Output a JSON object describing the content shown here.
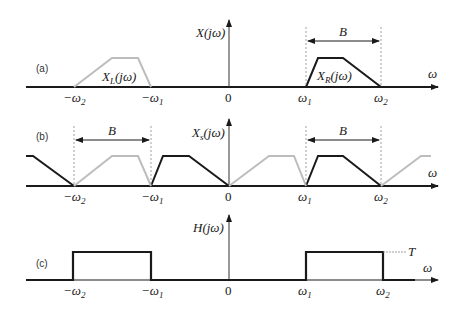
{
  "figure": {
    "panels": [
      {
        "id": "a",
        "label": "(a)",
        "axis_label": "X(jω)",
        "axis_label_parts": {
          "main": "X(jω)"
        },
        "x_axis_label": "ω",
        "ticks": {
          "neg_w2": "−ω",
          "neg_w2_sub": "2",
          "neg_w1": "−ω",
          "neg_w1_sub": "1",
          "zero": "0",
          "w1": "ω",
          "w1_sub": "1",
          "w2": "ω",
          "w2_sub": "2"
        },
        "left_spectrum": {
          "name": "X",
          "sub": "L",
          "arg": "(jω)",
          "color": "#bdbdbd"
        },
        "right_spectrum": {
          "name": "X",
          "sub": "R",
          "arg": "(jω)",
          "color": "#1a1a1a"
        },
        "bandwidth_label": "B"
      },
      {
        "id": "b",
        "label": "(b)",
        "axis_label_main": "X",
        "axis_label_sub": "s",
        "axis_label_arg": "(jω)",
        "x_axis_label": "ω",
        "ticks": {
          "neg_w2": "−ω",
          "neg_w2_sub": "2",
          "neg_w1": "−ω",
          "neg_w1_sub": "1",
          "zero": "0",
          "w1": "ω",
          "w1_sub": "1",
          "w2": "ω",
          "w2_sub": "2"
        },
        "bandwidth_left_label": "B",
        "bandwidth_right_label": "B"
      },
      {
        "id": "c",
        "label": "(c)",
        "axis_label": "H(jω)",
        "x_axis_label": "ω",
        "ticks": {
          "neg_w2": "−ω",
          "neg_w2_sub": "2",
          "neg_w1": "−ω",
          "neg_w1_sub": "1",
          "zero": "0",
          "w1": "ω",
          "w1_sub": "1",
          "w2": "ω",
          "w2_sub": "2"
        },
        "gain_label": "T"
      }
    ],
    "colors": {
      "dark": "#1a1a1a",
      "light": "#bdbdbd",
      "axis": "#333333",
      "dashed": "#888888"
    }
  }
}
